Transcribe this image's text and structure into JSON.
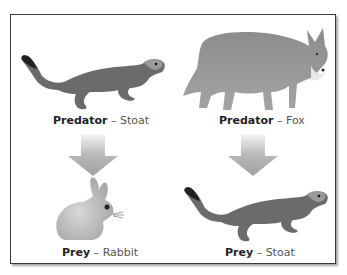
{
  "diagram": {
    "title_clipped": "",
    "panels": [
      {
        "position": "top-left",
        "role": "Predator",
        "separator": " – ",
        "animal": "Stoat",
        "image": "stoat-illustration"
      },
      {
        "position": "top-right",
        "role": "Predator",
        "separator": " – ",
        "animal": "Fox",
        "image": "fox-illustration"
      },
      {
        "position": "bottom-left",
        "role": "Prey",
        "separator": " – ",
        "animal": "Rabbit",
        "image": "rabbit-illustration"
      },
      {
        "position": "bottom-right",
        "role": "Prey",
        "separator": " – ",
        "animal": "Stoat",
        "image": "stoat-illustration"
      }
    ],
    "arrows": [
      {
        "from": "Predator – Stoat",
        "to": "Prey – Rabbit",
        "icon": "down-arrow-icon"
      },
      {
        "from": "Predator – Fox",
        "to": "Prey – Stoat",
        "icon": "down-arrow-icon"
      }
    ],
    "colors": {
      "frame_border": "#3a3a3a",
      "animal_grey": "#6b6b6b",
      "arrow_grey": "#a8a8a8",
      "caption_bold": "#222222",
      "caption_light": "#555555"
    }
  }
}
